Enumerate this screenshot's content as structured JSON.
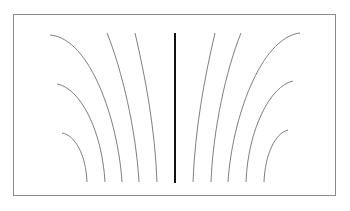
{
  "diagram": {
    "title": "",
    "colors": {
      "background": "#ffffff",
      "frame": "#8a8a8a",
      "field_line": "#707070",
      "center_line": "#111111"
    },
    "frame": {
      "x": 13,
      "y": 14,
      "width": 322,
      "height": 181
    },
    "center_line": {
      "x": 175,
      "y1": 33,
      "y2": 183
    },
    "field_lines": {
      "left": [
        {
          "id": "L1",
          "d": "M62,133 C75,135 86,155 87,182"
        },
        {
          "id": "L2",
          "d": "M57,84 C80,88 102,130 105,182"
        },
        {
          "id": "L3",
          "d": "M50,35 C90,38 118,120 122,182"
        },
        {
          "id": "L4",
          "d": "M107,33 C122,70 136,130 139,182"
        },
        {
          "id": "L5",
          "d": "M135,33 C146,80 155,130 157,182"
        }
      ],
      "right": [
        {
          "id": "R1",
          "d": "M215,33 C204,80 195,130 193,182"
        },
        {
          "id": "R2",
          "d": "M241,33 C226,70 213,130 211,182"
        },
        {
          "id": "R3",
          "d": "M300,33 C260,38 232,120 228,182"
        },
        {
          "id": "R4",
          "d": "M293,81 C270,86 248,130 246,182"
        },
        {
          "id": "R5",
          "d": "M288,130 C275,133 265,155 264,182"
        }
      ]
    }
  }
}
